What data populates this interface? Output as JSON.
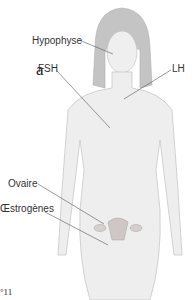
{
  "figure": {
    "fragments": {
      "left_letter": "a",
      "bottom_text": "°11"
    },
    "labels": {
      "hypophyse": "Hypophyse",
      "fsh": "FSH",
      "lh": "LH",
      "ovaire": "Ovaire",
      "oestrogenes": "Œstrogènes"
    },
    "colors": {
      "figure_fill": "#ededed",
      "figure_stroke": "#bdbdbd",
      "hair": "#b8b8b8",
      "organ": "#c9c0c0",
      "leader": "#555555"
    }
  }
}
